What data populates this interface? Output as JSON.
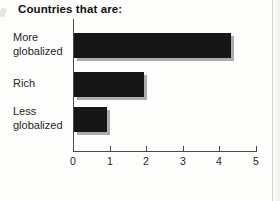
{
  "chart_data": {
    "type": "bar",
    "orientation": "horizontal",
    "title": "Countries that are:",
    "categories": [
      "More globalized",
      "Rich",
      "Less globalized"
    ],
    "values": [
      4.3,
      1.9,
      0.9
    ],
    "xlim": [
      0,
      5
    ],
    "xticks": [
      0,
      1,
      2,
      3,
      4,
      5
    ],
    "xlabel": "",
    "ylabel": "",
    "grid": false,
    "legend": "none",
    "bar_color": "#161616",
    "bar_shadow_color": "#acacac",
    "axis_color": "#4a4a4a",
    "text_color": "#262626"
  }
}
